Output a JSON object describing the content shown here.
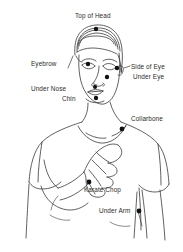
{
  "diagram": {
    "background_color": "#ffffff",
    "line_color": "#3a3a3a",
    "point_color": "#111111",
    "label_color": "#2b2b2b",
    "points": [
      {
        "id": "top-of-head",
        "label": "Top of Head",
        "dot": {
          "x": 96,
          "y": 29
        },
        "label_pos": {
          "x": 75,
          "y": 12
        },
        "align": "left",
        "leader": null
      },
      {
        "id": "eyebrow",
        "label": "Eyebrow",
        "dot": {
          "x": 88,
          "y": 64
        },
        "label_pos": {
          "x": 31,
          "y": 60
        },
        "align": "left",
        "leader": {
          "x1": 68,
          "y1": 68,
          "x2": 72,
          "y2": 56
        }
      },
      {
        "id": "side-of-eye",
        "label": "Side of Eye",
        "dot": {
          "x": 117,
          "y": 68
        },
        "label_pos": {
          "x": 131,
          "y": 63
        },
        "align": "left",
        "leader": {
          "x1": 124,
          "y1": 67,
          "x2": 130,
          "y2": 66
        }
      },
      {
        "id": "under-eye",
        "label": "Under Eye",
        "dot": {
          "x": 107,
          "y": 77
        },
        "label_pos": {
          "x": 133,
          "y": 73
        },
        "align": "left",
        "leader": null
      },
      {
        "id": "under-nose",
        "label": "Under Nose",
        "dot": {
          "x": 95,
          "y": 87
        },
        "label_pos": {
          "x": 31,
          "y": 85
        },
        "align": "left",
        "leader": null
      },
      {
        "id": "chin",
        "label": "Chin",
        "dot": {
          "x": 96,
          "y": 98
        },
        "label_pos": {
          "x": 62,
          "y": 95
        },
        "align": "left",
        "leader": null
      },
      {
        "id": "collarbone",
        "label": "Collarbone",
        "dot": {
          "x": 122,
          "y": 129
        },
        "label_pos": {
          "x": 131,
          "y": 115
        },
        "align": "left",
        "leader": null
      },
      {
        "id": "karate-chop",
        "label": "Karate Chop",
        "dot": {
          "x": 89,
          "y": 182
        },
        "label_pos": {
          "x": 84,
          "y": 186
        },
        "align": "left",
        "leader": null
      },
      {
        "id": "under-arm",
        "label": "Under Arm",
        "dot": {
          "x": 139,
          "y": 211
        },
        "label_pos": {
          "x": 99,
          "y": 207
        },
        "align": "left",
        "leader": null
      }
    ]
  }
}
